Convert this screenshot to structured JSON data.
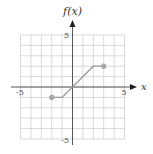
{
  "chart_data": {
    "type": "line",
    "title": "",
    "xlabel": "x",
    "ylabel": "f(x)",
    "xlim": [
      -5,
      5
    ],
    "ylim": [
      -5,
      5
    ],
    "grid": true,
    "x_tick_labels": [
      "-5",
      "5"
    ],
    "y_tick_labels": [
      "5",
      "-5"
    ],
    "series": [
      {
        "name": "f(x)",
        "points": [
          [
            -2,
            -1
          ],
          [
            -1,
            -1
          ],
          [
            2,
            2
          ],
          [
            3,
            2
          ]
        ],
        "endpoints": [
          {
            "x": -2,
            "y": -1,
            "style": "closed"
          },
          {
            "x": 3,
            "y": 2,
            "style": "closed"
          }
        ]
      }
    ],
    "legend": null
  },
  "colors": {
    "grid": "#cfcfcf",
    "axis": "#555555",
    "line": "#9a9a9a",
    "point": "#a8a8a8"
  },
  "labels": {
    "y_axis_title": "f(x)",
    "x_axis_title": "x",
    "x_min": "-5",
    "x_max": "5",
    "y_max": "5",
    "y_min": "-5"
  }
}
